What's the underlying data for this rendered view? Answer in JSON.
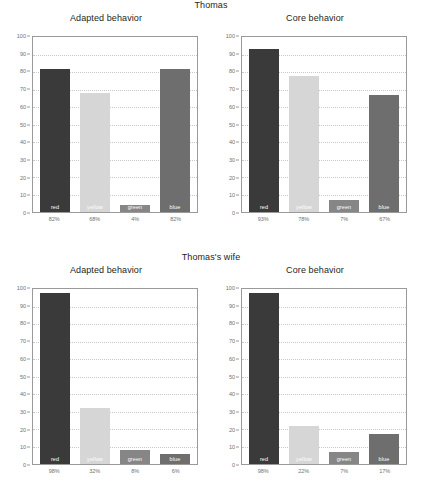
{
  "chart_data": [
    {
      "type": "bar",
      "title": "Adapted behavior",
      "group": "Thomas",
      "categories": [
        "red",
        "yellow",
        "green",
        "blue"
      ],
      "values": [
        82,
        68,
        4,
        82
      ],
      "value_labels": [
        "82%",
        "68%",
        "4%",
        "82%"
      ],
      "xlabel": "",
      "ylabel": "",
      "ylim": [
        0,
        100
      ],
      "ytick_step": 10,
      "grid": true,
      "legend": "none"
    },
    {
      "type": "bar",
      "title": "Core behavior",
      "group": "Thomas",
      "categories": [
        "red",
        "yellow",
        "green",
        "blue"
      ],
      "values": [
        93,
        78,
        7,
        67
      ],
      "value_labels": [
        "93%",
        "78%",
        "7%",
        "67%"
      ],
      "xlabel": "",
      "ylabel": "",
      "ylim": [
        0,
        100
      ],
      "ytick_step": 10,
      "grid": true,
      "legend": "none"
    },
    {
      "type": "bar",
      "title": "Adapted behavior",
      "group": "Thomas's wife",
      "categories": [
        "red",
        "yellow",
        "green",
        "blue"
      ],
      "values": [
        98,
        32,
        8,
        6
      ],
      "value_labels": [
        "98%",
        "32%",
        "8%",
        "6%"
      ],
      "xlabel": "",
      "ylabel": "",
      "ylim": [
        0,
        100
      ],
      "ytick_step": 10,
      "grid": true,
      "legend": "none"
    },
    {
      "type": "bar",
      "title": "Core behavior",
      "group": "Thomas's wife",
      "categories": [
        "red",
        "yellow",
        "green",
        "blue"
      ],
      "values": [
        98,
        22,
        7,
        17
      ],
      "value_labels": [
        "98%",
        "22%",
        "7%",
        "17%"
      ],
      "xlabel": "",
      "ylabel": "",
      "ylim": [
        0,
        100
      ],
      "ytick_step": 10,
      "grid": true,
      "legend": "none"
    }
  ],
  "sections": [
    {
      "group_title": "Thomas",
      "charts": [
        {
          "title": "Adapted behavior",
          "bars": [
            {
              "label": "red",
              "value": 82,
              "value_label": "82%"
            },
            {
              "label": "yellow",
              "value": 68,
              "value_label": "68%"
            },
            {
              "label": "green",
              "value": 4,
              "value_label": "4%"
            },
            {
              "label": "blue",
              "value": 82,
              "value_label": "82%"
            }
          ]
        },
        {
          "title": "Core behavior",
          "bars": [
            {
              "label": "red",
              "value": 93,
              "value_label": "93%"
            },
            {
              "label": "yellow",
              "value": 78,
              "value_label": "78%"
            },
            {
              "label": "green",
              "value": 7,
              "value_label": "7%"
            },
            {
              "label": "blue",
              "value": 67,
              "value_label": "67%"
            }
          ]
        }
      ]
    },
    {
      "group_title": "Thomas's wife",
      "charts": [
        {
          "title": "Adapted behavior",
          "bars": [
            {
              "label": "red",
              "value": 98,
              "value_label": "98%"
            },
            {
              "label": "yellow",
              "value": 32,
              "value_label": "32%"
            },
            {
              "label": "green",
              "value": 8,
              "value_label": "8%"
            },
            {
              "label": "blue",
              "value": 6,
              "value_label": "6%"
            }
          ]
        },
        {
          "title": "Core behavior",
          "bars": [
            {
              "label": "red",
              "value": 98,
              "value_label": "98%"
            },
            {
              "label": "yellow",
              "value": 22,
              "value_label": "22%"
            },
            {
              "label": "green",
              "value": 7,
              "value_label": "7%"
            },
            {
              "label": "blue",
              "value": 17,
              "value_label": "17%"
            }
          ]
        }
      ]
    }
  ],
  "axis": {
    "y_ticks": [
      100,
      90,
      80,
      70,
      60,
      50,
      40,
      30,
      20,
      10,
      0
    ],
    "y_min": 0,
    "y_max": 100
  },
  "colors": {
    "red": "#3a3a3a",
    "yellow": "#d6d6d6",
    "green": "#868686",
    "blue": "#6e6e6e",
    "grid": "#c8c8c8",
    "axis": "#9a9a9a",
    "tick_text": "#6f6f6f",
    "title_text": "#231f20",
    "bar_label_text": "#ffffff",
    "background": "#ffffff"
  }
}
